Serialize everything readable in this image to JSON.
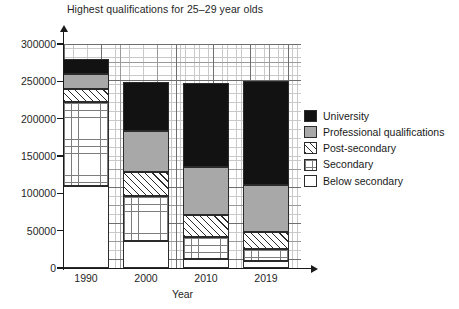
{
  "chart_data": {
    "type": "bar",
    "subtype": "stacked-bar",
    "title": "Highest qualifications for 25–29 year olds",
    "xlabel": "Year",
    "ylabel": "",
    "categories": [
      "1990",
      "2000",
      "2010",
      "2019"
    ],
    "ylim": [
      0,
      300000
    ],
    "ytick_labels": [
      "0",
      "50000",
      "100000",
      "150000",
      "200000",
      "250000",
      "300000"
    ],
    "ytick_values": [
      0,
      50000,
      100000,
      150000,
      200000,
      250000,
      300000
    ],
    "grid": true,
    "legend_position": "right",
    "stack_order_bottom_to_top": [
      "Below secondary",
      "Secondary",
      "Post-secondary",
      "Professional qualifications",
      "University"
    ],
    "series": [
      {
        "name": "Below secondary",
        "pattern": "dashed-horizontal",
        "color": "#ffffff",
        "values": [
          110000,
          36000,
          12000,
          9000
        ]
      },
      {
        "name": "Secondary",
        "pattern": "fine-grid",
        "color": "#ffffff",
        "values": [
          112000,
          60000,
          30000,
          17000
        ]
      },
      {
        "name": "Post-secondary",
        "pattern": "diagonal-hatch",
        "color": "#ffffff",
        "values": [
          18000,
          32000,
          29000,
          22000
        ]
      },
      {
        "name": "Professional qualifications",
        "pattern": "solid",
        "color": "#a8a8a8",
        "values": [
          20000,
          55000,
          64000,
          63000
        ]
      },
      {
        "name": "University",
        "pattern": "solid",
        "color": "#121212",
        "values": [
          20000,
          66000,
          113000,
          140000
        ]
      }
    ],
    "cumulative_tops": {
      "1990": [
        110000,
        222000,
        240000,
        260000,
        280000
      ],
      "2000": [
        36000,
        96000,
        128000,
        183000,
        249000
      ],
      "2010": [
        12000,
        42000,
        71000,
        135000,
        248000
      ],
      "2019": [
        9000,
        26000,
        48000,
        111000,
        251000
      ]
    },
    "totals": [
      280000,
      249000,
      248000,
      251000
    ]
  },
  "legend": {
    "items": [
      {
        "label": "University",
        "swatch": "solid-black-swatch"
      },
      {
        "label": "Professional qualifications",
        "swatch": "solid-gray-swatch"
      },
      {
        "label": "Post-secondary",
        "swatch": "diagonal-hatch-swatch"
      },
      {
        "label": "Secondary",
        "swatch": "fine-grid-swatch"
      },
      {
        "label": "Below secondary",
        "swatch": "dashed-horizontal-swatch"
      }
    ]
  }
}
